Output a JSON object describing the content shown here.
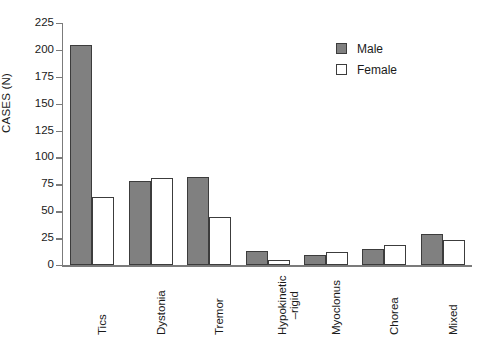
{
  "chart_data": {
    "type": "bar",
    "title": "",
    "xlabel": "",
    "ylabel": "CASES (N)",
    "ylim": [
      0,
      225
    ],
    "ytick_step": 25,
    "yticks": [
      225,
      200,
      175,
      150,
      125,
      100,
      75,
      50,
      25,
      0
    ],
    "grid": false,
    "legend_position": "top-right",
    "categories": [
      "Tics",
      "Dystonia",
      "Tremor",
      "Hypokinetic–rigid",
      "Myoclonus",
      "Chorea",
      "Mixed"
    ],
    "category_labels": [
      {
        "line1": "Tics",
        "line2": ""
      },
      {
        "line1": "Dystonia",
        "line2": ""
      },
      {
        "line1": "Tremor",
        "line2": ""
      },
      {
        "line1": "Hypokinetic",
        "line2": "–rigid"
      },
      {
        "line1": "Myoclonus",
        "line2": ""
      },
      {
        "line1": "Chorea",
        "line2": ""
      },
      {
        "line1": "Mixed",
        "line2": ""
      }
    ],
    "series": [
      {
        "name": "Male",
        "color": "#808080",
        "values": [
          205,
          78,
          82,
          13,
          9,
          15,
          29
        ]
      },
      {
        "name": "Female",
        "color": "#ffffff",
        "values": [
          63,
          81,
          45,
          5,
          12,
          19,
          23
        ]
      }
    ]
  },
  "legend": {
    "items": [
      {
        "label": "Male",
        "swatch": "filled-gray-square"
      },
      {
        "label": "Female",
        "swatch": "open-white-square"
      }
    ]
  },
  "colors": {
    "male_fill": "#808080",
    "female_fill": "#ffffff",
    "bar_outline": "#3c3c3c",
    "axis": "#7b7b7b",
    "text": "#1a1a1a",
    "background": "#ffffff"
  }
}
